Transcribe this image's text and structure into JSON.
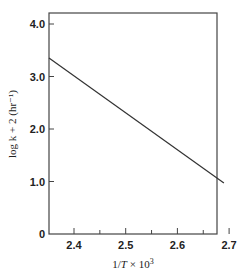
{
  "chart_data": {
    "type": "line",
    "title": "",
    "xlabel": "1/T × 10³",
    "ylabel": "log k + 2 (hr⁻¹)",
    "xlim": [
      2.35,
      2.71
    ],
    "ylim": [
      0,
      4.2
    ],
    "x_ticks": [
      2.4,
      2.45,
      2.5,
      2.55,
      2.6,
      2.65,
      2.7
    ],
    "x_tick_labels": [
      "2.4",
      "",
      "2.5",
      "",
      "2.6",
      "",
      "2.7"
    ],
    "y_ticks": [
      0,
      1.0,
      2.0,
      3.0,
      4.0
    ],
    "y_tick_labels": [
      "0",
      "1.0",
      "2.0",
      "3.0",
      "4.0"
    ],
    "grid": false,
    "legend": null,
    "series": [
      {
        "name": "log k + 2",
        "x": [
          2.35,
          2.69
        ],
        "y": [
          3.35,
          0.97
        ],
        "color": "#333333"
      }
    ]
  },
  "labels": {
    "xlabel_main": "1/",
    "xlabel_T": "T",
    "xlabel_rest": " × 10",
    "xlabel_sup": "3",
    "ylabel_text": "log k + 2 (hr⁻¹)"
  }
}
